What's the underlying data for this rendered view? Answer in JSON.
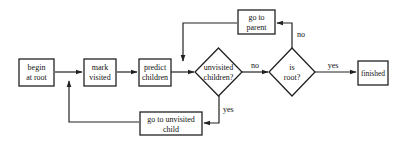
{
  "diagram": {
    "type": "flowchart",
    "colors": {
      "stroke": "#222222",
      "background": "#ffffff",
      "text": "#111111"
    },
    "nodes": {
      "begin": {
        "shape": "rect",
        "line1": "begin",
        "line2": "at root"
      },
      "mark": {
        "shape": "rect",
        "line1": "mark",
        "line2": "visited"
      },
      "predict": {
        "shape": "rect",
        "line1": "predict",
        "line2": "children"
      },
      "unvisited": {
        "shape": "diamond",
        "line1": "unvisited",
        "line2": "children?"
      },
      "isroot": {
        "shape": "diamond",
        "line1": "is",
        "line2": "root?"
      },
      "finished": {
        "shape": "rect",
        "line1": "finished"
      },
      "parent": {
        "shape": "rect",
        "line1": "go to",
        "line2": "parent"
      },
      "child": {
        "shape": "rect",
        "line1": "go to unvisited",
        "line2": "child"
      }
    },
    "edges": [
      {
        "from": "begin",
        "to": "mark",
        "label": ""
      },
      {
        "from": "mark",
        "to": "predict",
        "label": ""
      },
      {
        "from": "predict",
        "to": "unvisited",
        "label": ""
      },
      {
        "from": "unvisited",
        "to": "isroot",
        "label": "no"
      },
      {
        "from": "unvisited",
        "to": "child",
        "label": "yes"
      },
      {
        "from": "isroot",
        "to": "finished",
        "label": "yes"
      },
      {
        "from": "isroot",
        "to": "parent",
        "label": "no"
      },
      {
        "from": "parent",
        "to": "unvisited",
        "label": ""
      },
      {
        "from": "child",
        "to": "mark",
        "label": ""
      }
    ],
    "edge_labels": {
      "unvisited_no": "no",
      "unvisited_yes": "yes",
      "isroot_yes": "yes",
      "isroot_no": "no"
    }
  }
}
